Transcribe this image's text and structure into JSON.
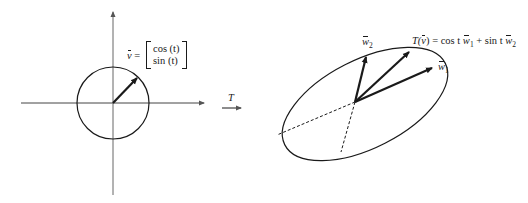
{
  "left_figure": {
    "axes": {
      "origin": [
        113,
        103
      ],
      "x_range": [
        21,
        204
      ],
      "y_range": [
        12,
        195
      ]
    },
    "circle": {
      "center": [
        113,
        103
      ],
      "radius": 36
    },
    "vector": {
      "from": [
        113,
        103
      ],
      "to": [
        137,
        78
      ]
    },
    "label": {
      "vector_name": "v",
      "equals": "=",
      "row1": "cos (t)",
      "row2": "sin (t)"
    }
  },
  "transform_arrow": {
    "label": "T",
    "from": [
      222,
      108
    ],
    "to": [
      241,
      108
    ]
  },
  "right_figure": {
    "ellipse": {
      "center": [
        365,
        104
      ],
      "rx": 90,
      "ry": 44,
      "rotation_deg": -27
    },
    "origin": [
      355,
      102
    ],
    "vectors": [
      {
        "name": "w2",
        "to": [
          366,
          57
        ]
      },
      {
        "name": "T(v)",
        "to": [
          409,
          52
        ]
      },
      {
        "name": "w1",
        "to": [
          432,
          68
        ]
      }
    ],
    "dashed": [
      {
        "to": [
          277,
          135
        ]
      },
      {
        "to": [
          341,
          152
        ]
      }
    ],
    "labels": {
      "w2": {
        "base": "w",
        "sub": "2"
      },
      "w1": {
        "base": "w",
        "sub": "1"
      },
      "formula": {
        "lhs_T": "T(",
        "lhs_v": "v",
        "lhs_close": ")",
        "equals_cos": " = cos t ",
        "w1_base": "w",
        "w1_sub": "1",
        "plus_sin": " + sin t ",
        "w2_base": "w",
        "w2_sub": "2"
      }
    }
  }
}
